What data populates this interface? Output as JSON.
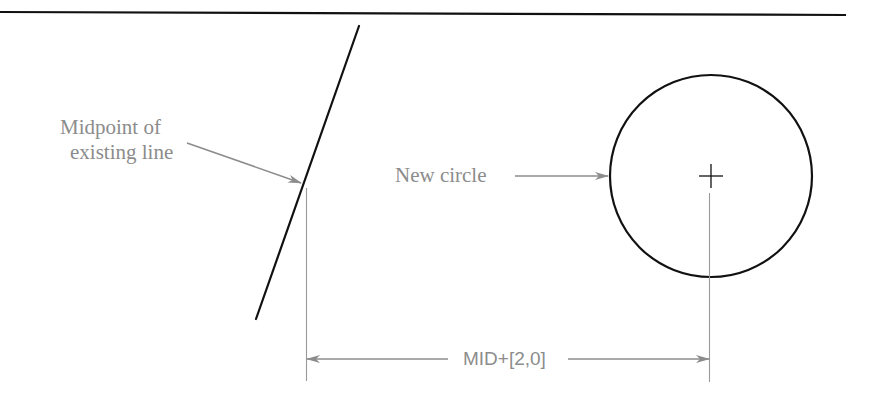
{
  "figure": {
    "background": "#ffffff",
    "annotation_color": "#8c8c8c",
    "geometry_color": "#111111"
  },
  "labels": {
    "midpoint_line1": "Midpoint of",
    "midpoint_line2": "existing line",
    "new_circle": "New circle",
    "dimension": "MID+[2,0]"
  },
  "elements": {
    "top_rule": {
      "x1": 0,
      "y1": 12,
      "x2": 846,
      "y2": 15
    },
    "existing_line": {
      "x1": 359,
      "y1": 26,
      "x2": 256,
      "y2": 319
    },
    "circle": {
      "cx": 711,
      "cy": 176,
      "r": 101
    },
    "center_mark": {
      "size": 12
    },
    "dimension_line_y": 359
  }
}
